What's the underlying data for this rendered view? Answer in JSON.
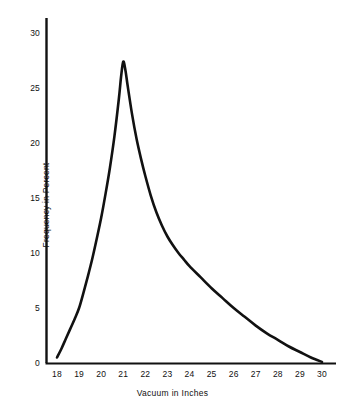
{
  "chart_data": {
    "type": "line",
    "title": "",
    "subtitle": "",
    "xlabel": "Vacuum in Inches",
    "ylabel": "Frequency in Percent",
    "xlim": [
      17.6,
      30.4
    ],
    "ylim": [
      0,
      31.5
    ],
    "xticks": [
      18,
      19,
      20,
      21,
      22,
      23,
      24,
      25,
      26,
      27,
      28,
      29,
      30
    ],
    "xtick_labels": [
      "18",
      "19",
      "20",
      "21",
      "22",
      "23",
      "24",
      "25",
      "26",
      "27",
      "28",
      "29",
      "30"
    ],
    "yticks": [
      0,
      5,
      10,
      15,
      20,
      25,
      30
    ],
    "ytick_labels": [
      "0",
      "5",
      "10",
      "15",
      "20",
      "25",
      "30"
    ],
    "grid": false,
    "legend": null,
    "legend_position": "none",
    "line_color": "#111111",
    "line_width": 2.6,
    "axis_color": "#111111",
    "background_color": "#ffffff",
    "series": [
      {
        "name": "Vacuum frequency distribution",
        "x": [
          18.0,
          18.2,
          18.4,
          18.6,
          18.8,
          19.0,
          19.2,
          19.4,
          19.6,
          19.8,
          20.0,
          20.2,
          20.4,
          20.6,
          20.8,
          20.9,
          21.0,
          21.1,
          21.2,
          21.4,
          21.6,
          21.8,
          22.0,
          22.25,
          22.5,
          22.75,
          23.0,
          23.25,
          23.5,
          23.75,
          24.0,
          24.5,
          25.0,
          25.5,
          26.0,
          26.5,
          27.0,
          27.5,
          28.0,
          28.5,
          29.0,
          29.5,
          30.0
        ],
        "y": [
          0.5,
          1.3,
          2.2,
          3.1,
          4.0,
          5.0,
          6.4,
          7.9,
          9.5,
          11.3,
          13.2,
          15.4,
          17.8,
          20.6,
          24.0,
          26.0,
          27.4,
          26.6,
          25.2,
          22.6,
          20.4,
          18.6,
          17.0,
          15.2,
          13.7,
          12.5,
          11.5,
          10.7,
          10.0,
          9.4,
          8.8,
          7.8,
          6.8,
          5.9,
          5.0,
          4.2,
          3.4,
          2.7,
          2.1,
          1.5,
          1.0,
          0.5,
          0.1
        ]
      }
    ],
    "annotations": [
      {
        "label": "peak",
        "x": 21.0,
        "y": 27.4
      }
    ]
  },
  "axes": {
    "y_title": "Frequency in Percent",
    "x_title": "Vacuum in Inches"
  }
}
